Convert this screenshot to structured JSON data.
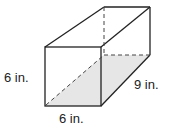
{
  "figure": {
    "type": "rectangular-prism",
    "labels": {
      "height": "6 in.",
      "width": "6 in.",
      "length": "9 in."
    },
    "colors": {
      "stroke": "#222222",
      "shade": "#e6e6e6",
      "background": "#ffffff"
    }
  }
}
